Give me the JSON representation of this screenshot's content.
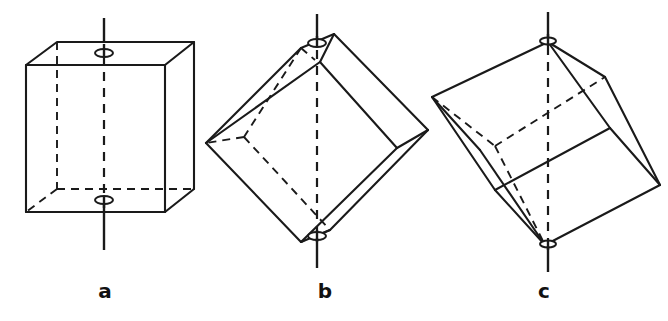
{
  "figure": {
    "kind": "line-drawing-plate",
    "background_color": "#ffffff",
    "ink_color": "#1a1a1a",
    "panel_count": 3,
    "panels": [
      {
        "id": "a",
        "caption": "a",
        "object": "cube",
        "orientation": "upright, resting on a face",
        "axis_name": "four-fold axis",
        "axis_passes_through": "centres of two opposite faces",
        "axis_direction": "vertical",
        "marker": "small ellipse where axis pierces each face",
        "marker_count": 2
      },
      {
        "id": "b",
        "caption": "b",
        "object": "cube",
        "orientation": "tilted, balanced on an edge",
        "axis_name": "two-fold axis",
        "axis_passes_through": "midpoints of two opposite edges",
        "axis_direction": "vertical",
        "marker": "small ellipse where axis meets each edge midpoint",
        "marker_count": 2
      },
      {
        "id": "c",
        "caption": "c",
        "object": "cube",
        "orientation": "tilted, balanced on a corner",
        "axis_name": "three-fold axis",
        "axis_passes_through": "two opposite vertices (body diagonal)",
        "axis_direction": "vertical",
        "marker": "small ellipse at each vertex on the axis",
        "marker_count": 2
      }
    ],
    "line_styles": {
      "visible_edge": "solid",
      "hidden_edge": "dashed",
      "axis_outside_solid": "solid",
      "axis_inside_solid": "dashed"
    }
  },
  "captions": {
    "a": "a",
    "b": "b",
    "c": "c"
  },
  "cut_caption": {
    "text": ""
  }
}
